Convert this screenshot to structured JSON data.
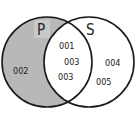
{
  "diagram": {
    "type": "venn",
    "colors": {
      "shade": "#b8b8b8",
      "stroke": "#1a1a1a",
      "background": "#ffffff",
      "label_box": "#c9c9c9"
    },
    "sets": [
      {
        "name": "P",
        "shaded": "difference P minus S"
      },
      {
        "name": "S",
        "shaded": "none"
      }
    ],
    "regions": {
      "p_only": [
        "002"
      ],
      "intersection": [
        "001",
        "003",
        "003"
      ],
      "s_only": [
        "004",
        "005"
      ]
    }
  }
}
